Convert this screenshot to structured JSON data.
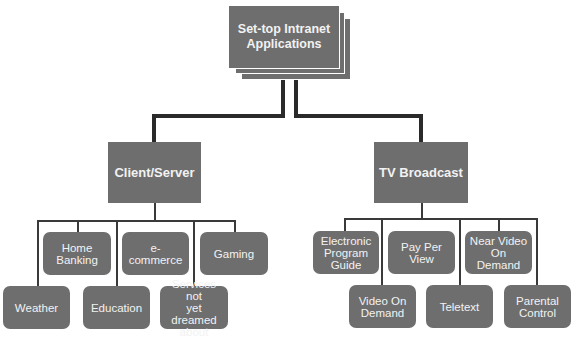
{
  "diagram": {
    "type": "hierarchy",
    "root": {
      "label": "Set-top Intranet\nApplications"
    },
    "branches": [
      {
        "label": "Client/Server",
        "children": [
          {
            "label": "Home\nBanking"
          },
          {
            "label": "e-commerce"
          },
          {
            "label": "Gaming"
          },
          {
            "label": "Weather"
          },
          {
            "label": "Education"
          },
          {
            "label": "Services not\nyet dreamed\nabout"
          }
        ]
      },
      {
        "label": "TV Broadcast",
        "children": [
          {
            "label": "Electronic\nProgram\nGuide"
          },
          {
            "label": "Pay Per\nView"
          },
          {
            "label": "Near Video\nOn Demand"
          },
          {
            "label": "Video On\nDemand"
          },
          {
            "label": "Teletext"
          },
          {
            "label": "Parental\nControl"
          }
        ]
      }
    ]
  },
  "colors": {
    "box_fill": "#6e6e6e",
    "box_text": "#f2f2f2",
    "connector": "#2a2a2a",
    "background": "#ffffff"
  }
}
